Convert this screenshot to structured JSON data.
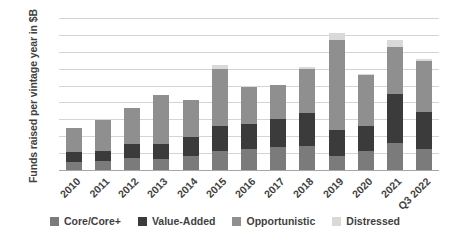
{
  "chart_data": {
    "type": "bar",
    "stacked": true,
    "title": "",
    "xlabel": "",
    "ylabel": "Funds raised per vintage year in $B",
    "ylim": [
      0,
      180
    ],
    "yticks": [
      0,
      20,
      40,
      60,
      80,
      100,
      120,
      140,
      160,
      180
    ],
    "grid": true,
    "legend_position": "bottom",
    "categories": [
      "2010",
      "2011",
      "2012",
      "2013",
      "2014",
      "2015",
      "2016",
      "2017",
      "2018",
      "2019",
      "2020",
      "2021",
      "Q3 2022"
    ],
    "series": [
      {
        "name": "Core/Core+",
        "color": "#7b7b7b",
        "values": [
          10,
          11,
          14,
          13,
          17,
          22,
          25,
          27,
          28,
          17,
          23,
          32,
          25
        ]
      },
      {
        "name": "Value-Added",
        "color": "#3b3b3b",
        "values": [
          11,
          11,
          17,
          18,
          22,
          30,
          30,
          34,
          39,
          30,
          29,
          58,
          44
        ]
      },
      {
        "name": "Opportunistic",
        "color": "#8f8f8f",
        "values": [
          29,
          37,
          42,
          58,
          44,
          68,
          43,
          40,
          53,
          107,
          60,
          56,
          60
        ]
      },
      {
        "name": "Distressed",
        "color": "#d9d9d9",
        "values": [
          0,
          0,
          0,
          0,
          0,
          4,
          2,
          0,
          2,
          8,
          2,
          8,
          2
        ]
      }
    ],
    "totals": [
      50,
      59,
      73,
      89,
      83,
      124,
      100,
      101,
      122,
      162,
      114,
      154,
      131
    ]
  },
  "legend": {
    "items": [
      {
        "label": "Core/Core+",
        "color": "#7b7b7b"
      },
      {
        "label": "Value-Added",
        "color": "#3b3b3b"
      },
      {
        "label": "Opportunistic",
        "color": "#8f8f8f"
      },
      {
        "label": "Distressed",
        "color": "#d9d9d9"
      }
    ]
  },
  "colors": {
    "gridline": "#d4d4d4",
    "axis": "#a6a6a6",
    "text": "#3f3f3f",
    "background": "#ffffff"
  }
}
